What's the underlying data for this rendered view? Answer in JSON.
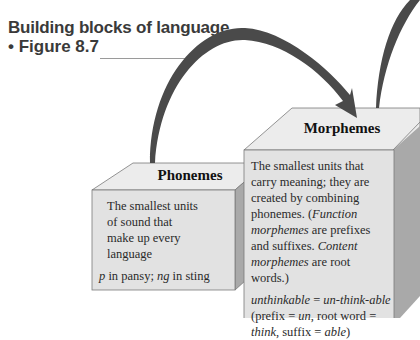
{
  "header": {
    "title": "Building blocks of language",
    "figure_label": "• Figure 8.7"
  },
  "blocks": {
    "phonemes": {
      "title": "Phonemes",
      "description": "The smallest units of sound that make up every language",
      "example_parts": [
        {
          "text": "p",
          "italic": true
        },
        {
          "text": " in pansy; ",
          "italic": false
        },
        {
          "text": "ng",
          "italic": true
        },
        {
          "text": " in sting",
          "italic": false
        }
      ]
    },
    "morphemes": {
      "title": "Morphemes",
      "desc_line1": "The smallest units that carry meaning; they are created by combining phonemes. (",
      "function_term": "Function morphemes",
      "desc_line2": " are prefixes and suffixes. ",
      "content_term": "Content morphemes",
      "desc_line3": " are root words.)",
      "example_word": "unthinkable",
      "example_eq": " = ",
      "example_split": "un-think-able",
      "example_paren_open": " (prefix = ",
      "prefix": "un",
      "root_label": ", root word = ",
      "root": "think",
      "suffix_label": ", suffix = ",
      "suffix": "able",
      "paren_close": ")"
    }
  },
  "colors": {
    "arrow": "#4a4a4a",
    "cube_front": "#e2e2e2",
    "cube_top": "#ececec",
    "cube_side": "#a9a9a9",
    "heading_text": "#3a3a3a"
  }
}
